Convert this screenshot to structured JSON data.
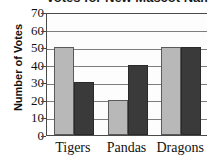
{
  "chart_data": {
    "type": "bar",
    "title": "Votes for New Mascot Name",
    "xlabel": "",
    "ylabel": "Number of Votes",
    "categories": [
      "Tigers",
      "Pandas",
      "Dragons"
    ],
    "series": [
      {
        "name": "light-series",
        "color": "#b8b8b8",
        "values": [
          50,
          20,
          50
        ]
      },
      {
        "name": "dark-series",
        "color": "#3a3a3a",
        "values": [
          30,
          40,
          50
        ]
      }
    ],
    "ylim": [
      0,
      70
    ],
    "ytick_values": [
      70,
      60,
      50,
      40,
      30,
      20,
      10,
      0
    ],
    "ytick_labels": [
      "70",
      "60",
      "50",
      "40",
      "30",
      "20",
      "10",
      "0"
    ],
    "grid": true,
    "legend": "none"
  }
}
